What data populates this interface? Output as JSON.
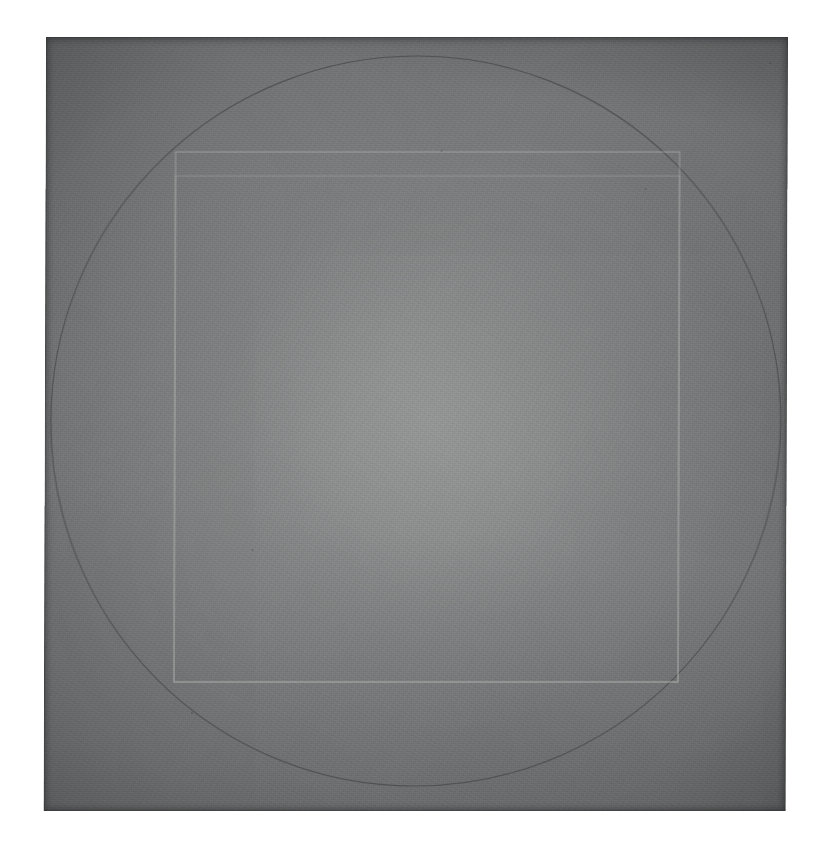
{
  "artwork": {
    "title": "Untitled (circle and squares on gray ground)",
    "medium_note": "graphite on painted panel",
    "background_color": "#ffffff",
    "panel": {
      "base_color": "#787a7b",
      "center_color": "#939493",
      "edge_color": "#5e6062",
      "left": 46,
      "top": 37,
      "width": 742,
      "height": 774
    },
    "marks": [
      {
        "name": "circle",
        "shape": "circle",
        "center_x": 417,
        "center_y": 421,
        "radius": 365,
        "stroke_color": "#4a4b4d",
        "stroke_width": 1.1,
        "note": "thin graphite circle, nearly inscribed in the panel"
      },
      {
        "name": "outer-square",
        "shape": "rect",
        "left": 176,
        "top": 152,
        "width": 504,
        "height": 530,
        "stroke_color": "#b9bab6",
        "stroke_width": 1.1,
        "note": "light incised square"
      },
      {
        "name": "inner-square",
        "shape": "rect",
        "left": 176,
        "top": 176,
        "width": 504,
        "height": 506,
        "stroke_color": "#aeafac",
        "stroke_width": 1.0,
        "note": "second square offset down from the first"
      },
      {
        "name": "short-top-segment",
        "shape": "line",
        "x1": 178,
        "y1": 177,
        "x2": 250,
        "y2": 177,
        "stroke_color": "#d2d3cf",
        "stroke_width": 1.4,
        "note": "brighter short stroke at upper-left of inner square"
      }
    ],
    "specks": [
      {
        "x": 441,
        "y": 150,
        "size": 2
      },
      {
        "x": 253,
        "y": 549,
        "size": 2
      },
      {
        "x": 193,
        "y": 712,
        "size": 2
      },
      {
        "x": 769,
        "y": 62,
        "size": 2
      },
      {
        "x": 645,
        "y": 188,
        "size": 2
      }
    ]
  }
}
